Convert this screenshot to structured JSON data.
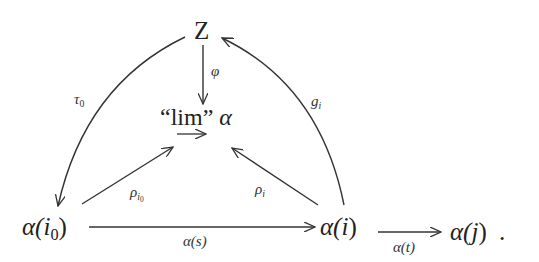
{
  "diagram": {
    "type": "commutative-diagram",
    "nodes": {
      "Z": {
        "label": "Z"
      },
      "lim": {
        "quote_open": "“",
        "text": "lim",
        "quote_close": "”",
        "symbol": "α",
        "under_arrow": "→"
      },
      "alpha_i0": {
        "prefix": "α(",
        "var": "i",
        "sub": "0",
        "suffix": ")"
      },
      "alpha_i": {
        "prefix": "α(",
        "var": "i",
        "suffix": ")"
      },
      "alpha_j": {
        "prefix": "α(",
        "var": "j",
        "suffix": ")",
        "trailing": "."
      }
    },
    "arrows": [
      {
        "id": "phi",
        "from": "Z",
        "to": "lim",
        "label": "φ"
      },
      {
        "id": "tau0",
        "from": "Z",
        "to": "alpha_i0",
        "label": "τ",
        "label_sub": "0"
      },
      {
        "id": "g_i",
        "from": "alpha_i",
        "to": "Z",
        "label": "g",
        "label_sub": "i"
      },
      {
        "id": "rho_i0",
        "from": "alpha_i0",
        "to": "lim",
        "label": "ρ",
        "label_sub": "i",
        "label_subsub": "0"
      },
      {
        "id": "rho_i",
        "from": "alpha_i",
        "to": "lim",
        "label": "ρ",
        "label_sub": "i"
      },
      {
        "id": "alpha_s",
        "from": "alpha_i0",
        "to": "alpha_i",
        "label": "α(s)"
      },
      {
        "id": "alpha_t",
        "from": "alpha_i",
        "to": "alpha_j",
        "label": "α(t)"
      }
    ]
  }
}
